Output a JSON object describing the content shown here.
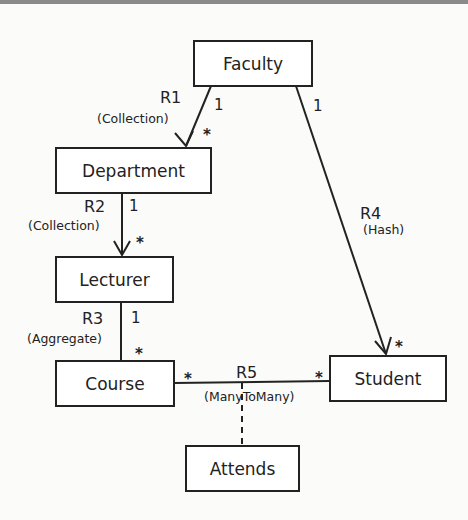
{
  "diagram": {
    "type": "uml-class-relationship",
    "classes": {
      "faculty": "Faculty",
      "department": "Department",
      "lecturer": "Lecturer",
      "course": "Course",
      "student": "Student",
      "attends": "Attends"
    },
    "relationships": [
      {
        "name": "R1",
        "type": "(Collection)",
        "from": "Faculty",
        "to": "Department",
        "from_mult": "1",
        "to_mult": "*",
        "directed": true
      },
      {
        "name": "R2",
        "type": "(Collection)",
        "from": "Department",
        "to": "Lecturer",
        "from_mult": "1",
        "to_mult": "*",
        "directed": true
      },
      {
        "name": "R3",
        "type": "(Aggregate)",
        "from": "Lecturer",
        "to": "Course",
        "from_mult": "1",
        "to_mult": "*",
        "directed": false
      },
      {
        "name": "R4",
        "type": "(Hash)",
        "from": "Faculty",
        "to": "Student",
        "from_mult": "1",
        "to_mult": "*",
        "directed": true
      },
      {
        "name": "R5",
        "type": "(ManyToMany)",
        "from": "Course",
        "to": "Student",
        "from_mult": "*",
        "to_mult": "*",
        "directed": false,
        "association_class": "Attends"
      }
    ],
    "colors": {
      "line": "#222222",
      "background": "#fbfbfa",
      "border_top": "#8a8a8a"
    }
  }
}
